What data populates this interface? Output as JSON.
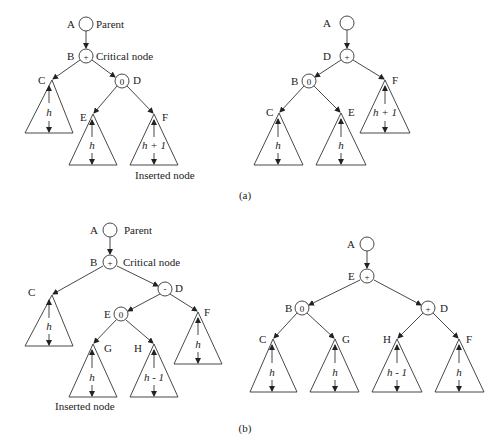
{
  "figure": {
    "part_a": {
      "caption": "(a)",
      "before": {
        "nodes": [
          {
            "id": "A",
            "label": "A",
            "balance": "",
            "note": "Parent",
            "x": 86,
            "y": 24
          },
          {
            "id": "B",
            "label": "B",
            "balance": "+",
            "note": "Critical node",
            "x": 86,
            "y": 56
          },
          {
            "id": "D",
            "label": "D",
            "balance": "0",
            "note": "",
            "x": 122,
            "y": 81
          }
        ],
        "subtrees": [
          {
            "id": "C",
            "label": "C",
            "height": "h",
            "apex": [
              52,
              80
            ],
            "base_y": 133,
            "half_w": 24
          },
          {
            "id": "E",
            "label": "E",
            "height": "h",
            "apex": [
              93,
              114
            ],
            "base_y": 165,
            "half_w": 24
          },
          {
            "id": "F",
            "label": "F",
            "height": "h + 1",
            "apex": [
              154,
              114
            ],
            "base_y": 165,
            "half_w": 24
          }
        ],
        "annotation": "Inserted node"
      },
      "after": {
        "nodes": [
          {
            "id": "A",
            "label": "A",
            "balance": "",
            "x": 347,
            "y": 23
          },
          {
            "id": "D",
            "label": "D",
            "balance": "+",
            "x": 347,
            "y": 56
          },
          {
            "id": "B",
            "label": "B",
            "balance": "0",
            "x": 309,
            "y": 81
          }
        ],
        "subtrees": [
          {
            "id": "C",
            "label": "C",
            "height": "h",
            "apex": [
              279,
              113
            ],
            "base_y": 165,
            "half_w": 25
          },
          {
            "id": "E",
            "label": "E",
            "height": "h",
            "apex": [
              341,
              113
            ],
            "base_y": 165,
            "half_w": 25
          },
          {
            "id": "F",
            "label": "F",
            "height": "h + 1",
            "apex": [
              385,
              80
            ],
            "base_y": 133,
            "half_w": 25
          }
        ]
      }
    },
    "part_b": {
      "caption": "(b)",
      "before": {
        "nodes": [
          {
            "id": "A",
            "label": "A",
            "balance": "",
            "note": "Parent",
            "x": 110,
            "y": 230
          },
          {
            "id": "B",
            "label": "B",
            "balance": "+",
            "note": "Critical node",
            "x": 110,
            "y": 262
          },
          {
            "id": "D",
            "label": "D",
            "balance": "-",
            "note": "",
            "x": 165,
            "y": 289
          },
          {
            "id": "E",
            "label": "E",
            "balance": "0",
            "note": "",
            "x": 121,
            "y": 314
          }
        ],
        "subtrees": [
          {
            "id": "C",
            "label": "C",
            "height": "h",
            "apex": [
              52,
              295
            ],
            "base_y": 346,
            "half_w": 24
          },
          {
            "id": "F",
            "label": "F",
            "height": "h",
            "apex": [
              198,
              312
            ],
            "base_y": 364,
            "half_w": 24
          },
          {
            "id": "G",
            "label": "G",
            "height": "h",
            "apex": [
              93,
              344
            ],
            "base_y": 397,
            "half_w": 24
          },
          {
            "id": "H",
            "label": "H",
            "height": "h - 1",
            "apex": [
              154,
              344
            ],
            "base_y": 397,
            "half_w": 24
          }
        ],
        "annotation": "Inserted node"
      },
      "after": {
        "nodes": [
          {
            "id": "A",
            "label": "A",
            "balance": "",
            "x": 367,
            "y": 244
          },
          {
            "id": "E",
            "label": "E",
            "balance": "+",
            "x": 367,
            "y": 276
          },
          {
            "id": "B",
            "label": "B",
            "balance": "0",
            "x": 302,
            "y": 308
          },
          {
            "id": "D",
            "label": "D",
            "balance": "+",
            "x": 428,
            "y": 308
          }
        ],
        "subtrees": [
          {
            "id": "C",
            "label": "C",
            "height": "h",
            "apex": [
              273,
              339
            ],
            "base_y": 392,
            "half_w": 24
          },
          {
            "id": "G",
            "label": "G",
            "height": "h",
            "apex": [
              335,
              339
            ],
            "base_y": 392,
            "half_w": 24
          },
          {
            "id": "H",
            "label": "H",
            "height": "h - 1",
            "apex": [
              397,
              339
            ],
            "base_y": 392,
            "half_w": 25
          },
          {
            "id": "F",
            "label": "F",
            "height": "h",
            "apex": [
              459,
              339
            ],
            "base_y": 392,
            "half_w": 24
          }
        ]
      }
    }
  }
}
